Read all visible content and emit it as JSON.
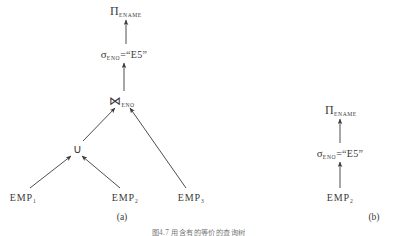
{
  "figure": {
    "caption": "图4.7  用含有的等价的查询树",
    "ink_color": "#3a3a3a",
    "background_color": "#ffffff"
  },
  "panels": [
    {
      "id": "panel-a",
      "label": "(a)",
      "nodes": [
        {
          "id": "a-project",
          "kind": "projection",
          "symbol": "Π",
          "subscript": "ENAME",
          "text": ""
        },
        {
          "id": "a-select",
          "kind": "selection",
          "symbol": "σ",
          "subscript": "ENO",
          "text": "=“E5”"
        },
        {
          "id": "a-join",
          "kind": "join",
          "symbol": "⋈",
          "subscript": "ENO",
          "text": ""
        },
        {
          "id": "a-union",
          "kind": "union",
          "symbol": "∪",
          "subscript": "",
          "text": ""
        },
        {
          "id": "a-emp1",
          "kind": "relation",
          "symbol": "EMP",
          "subscript": "1",
          "text": ""
        },
        {
          "id": "a-emp2",
          "kind": "relation",
          "symbol": "EMP",
          "subscript": "2",
          "text": ""
        },
        {
          "id": "a-emp3",
          "kind": "relation",
          "symbol": "EMP",
          "subscript": "3",
          "text": ""
        }
      ]
    },
    {
      "id": "panel-b",
      "label": "(b)",
      "nodes": [
        {
          "id": "b-project",
          "kind": "projection",
          "symbol": "Π",
          "subscript": "ENAME",
          "text": ""
        },
        {
          "id": "b-select",
          "kind": "selection",
          "symbol": "σ",
          "subscript": "ENO",
          "text": "=“E5”"
        },
        {
          "id": "b-emp2",
          "kind": "relation",
          "symbol": "EMP",
          "subscript": "2",
          "text": ""
        }
      ]
    }
  ]
}
